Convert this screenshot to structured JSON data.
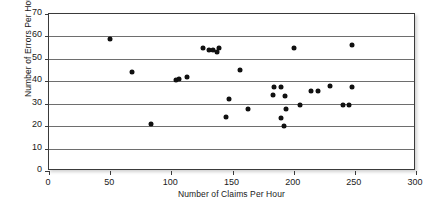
{
  "chart_data": {
    "type": "scatter",
    "title": "",
    "xlabel": "Number of Claims Per Hour",
    "ylabel": "Number of Errors Per Hour",
    "xlim": [
      0,
      300
    ],
    "ylim": [
      0,
      70
    ],
    "xticks": [
      0,
      50,
      100,
      150,
      200,
      250,
      300
    ],
    "yticks": [
      0,
      10,
      20,
      30,
      40,
      50,
      60,
      70
    ],
    "xtick_labels": [
      "0",
      "50",
      "100",
      "150",
      "200",
      "250",
      "300"
    ],
    "ytick_labels": [
      "0",
      "10",
      "20",
      "30",
      "40",
      "50",
      "60",
      "70"
    ],
    "grid": "horizontal",
    "legend": "none",
    "marker": "filled-circle",
    "marker_color": "#111111",
    "series": [
      {
        "name": "Claims vs Errors",
        "points": [
          [
            50,
            59
          ],
          [
            68,
            44
          ],
          [
            83,
            21
          ],
          [
            104,
            40.5
          ],
          [
            106,
            41
          ],
          [
            113,
            42
          ],
          [
            126,
            55
          ],
          [
            131,
            54
          ],
          [
            134,
            54
          ],
          [
            137,
            53
          ],
          [
            139,
            55
          ],
          [
            145,
            24
          ],
          [
            147,
            32
          ],
          [
            156,
            45
          ],
          [
            163,
            27.5
          ],
          [
            183,
            34
          ],
          [
            184,
            37.5
          ],
          [
            190,
            37.5
          ],
          [
            190,
            23.5
          ],
          [
            192,
            20
          ],
          [
            193,
            33.5
          ],
          [
            194,
            27.5
          ],
          [
            200,
            55
          ],
          [
            205,
            29.5
          ],
          [
            214,
            35.5
          ],
          [
            220,
            35.5
          ],
          [
            230,
            38
          ],
          [
            240,
            29.5
          ],
          [
            245,
            29.5
          ],
          [
            248,
            37.5
          ],
          [
            248,
            56
          ]
        ]
      }
    ]
  },
  "colors": {
    "marker": "#111111",
    "gridline": "#6e6e6e",
    "frame": "#3a3a3a",
    "text": "#1a1a1a",
    "background": "#ffffff"
  }
}
